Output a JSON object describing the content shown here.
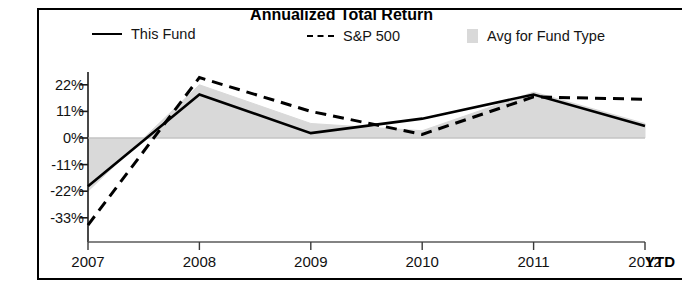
{
  "chart": {
    "title": "Annualized Total Return",
    "type": "line"
  },
  "legend": {
    "items": [
      {
        "label": "This Fund",
        "marker": "solid-line-swatch",
        "color": "#000000"
      },
      {
        "label": "S&P 500",
        "marker": "dashed-line-swatch",
        "color": "#000000"
      },
      {
        "label": "Avg for Fund Type",
        "marker": "gray-box-swatch",
        "color": "#d9d9d9"
      }
    ]
  },
  "axes": {
    "y_ticks": [
      "22%",
      "11%",
      "0%",
      "-11%",
      "-22%",
      "-33%"
    ],
    "x_ticks": [
      "2007",
      "2008",
      "2009",
      "2010",
      "2011",
      "2012"
    ],
    "x_suffix": "YTD"
  },
  "chart_data": {
    "type": "line",
    "title": "Annualized Total Return",
    "xlabel": "",
    "ylabel": "",
    "categories": [
      "2007",
      "2008",
      "2009",
      "2010",
      "2011",
      "2012"
    ],
    "x_axis_note": "2012 value is YTD",
    "ylim": [
      -36,
      27
    ],
    "y_ticks": [
      22,
      11,
      0,
      -11,
      -22,
      -33
    ],
    "y_tick_labels": [
      "22%",
      "11%",
      "0%",
      "-11%",
      "-22%",
      "-33%"
    ],
    "grid": false,
    "legend_position": "top",
    "series": [
      {
        "name": "This Fund",
        "style": "solid",
        "color": "#000000",
        "values": [
          -20,
          18,
          2,
          8,
          18,
          5
        ]
      },
      {
        "name": "S&P 500",
        "style": "dashed",
        "color": "#000000",
        "values": [
          -36,
          25,
          11,
          1.5,
          17,
          16
        ]
      },
      {
        "name": "Avg for Fund Type",
        "style": "area-band",
        "color": "#d9d9d9",
        "values": [
          -22,
          22,
          6,
          3,
          19,
          6
        ]
      }
    ]
  }
}
